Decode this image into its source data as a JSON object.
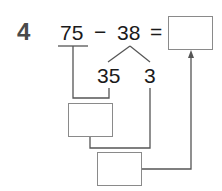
{
  "problem": {
    "number": "4",
    "minuend": "75",
    "operator": "−",
    "subtrahend": "38",
    "equals": "=",
    "split_parts": [
      "35",
      "3"
    ]
  },
  "boxes": {
    "answer": "",
    "step1": "",
    "step2": ""
  },
  "colors": {
    "text": "#1a1a1a",
    "question_number": "#4a4a4a",
    "lines": "#555555",
    "box_border": "#8a8a8a"
  }
}
